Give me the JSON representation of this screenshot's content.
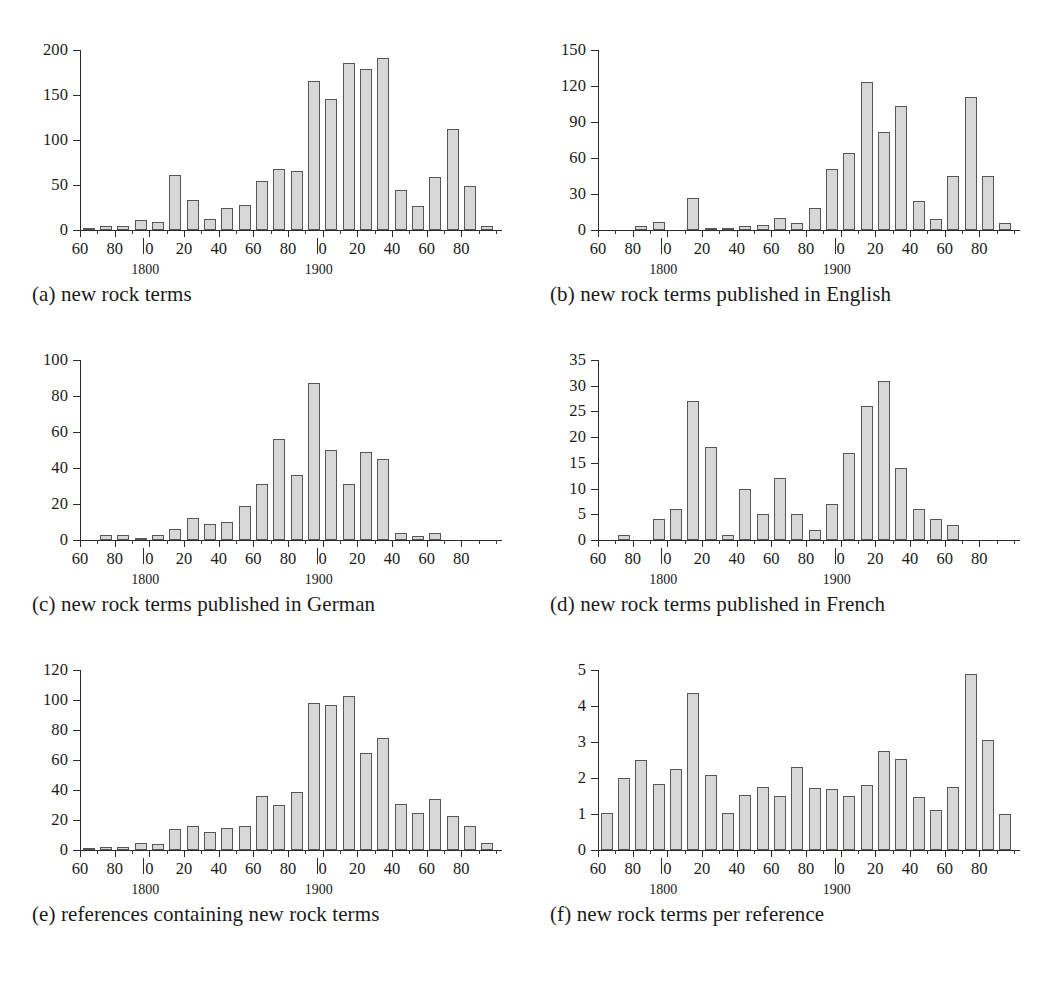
{
  "figure": {
    "panel_count": 6,
    "x_axis": {
      "decade_start": 1760,
      "decade_end": 1990,
      "bin_width_years": 10,
      "major_tick_labels": [
        "60",
        "80",
        "0",
        "20",
        "40",
        "60",
        "80",
        "0",
        "20",
        "40",
        "60",
        "80"
      ],
      "major_tick_years": [
        1760,
        1780,
        1800,
        1820,
        1840,
        1860,
        1880,
        1900,
        1920,
        1940,
        1960,
        1980
      ],
      "century_labels": [
        "1800",
        "1900"
      ],
      "century_years": [
        1800,
        1900
      ]
    },
    "bar_fill_color": "#d7d7d7",
    "bar_edge_color": "#565656",
    "axis_color": "#2b2b2b"
  },
  "chart_data": [
    {
      "id": "a",
      "type": "bar",
      "title": "",
      "caption": "(a) new rock terms",
      "xlabel": "",
      "ylabel": "",
      "ylim": [
        0,
        200
      ],
      "yticks": [
        0,
        50,
        100,
        150,
        200
      ],
      "grid": false,
      "legend": "none",
      "categories": [
        1760,
        1770,
        1780,
        1790,
        1800,
        1810,
        1820,
        1830,
        1840,
        1850,
        1860,
        1870,
        1880,
        1890,
        1900,
        1910,
        1920,
        1930,
        1940,
        1950,
        1960,
        1970,
        1980,
        1990
      ],
      "values": [
        1,
        4,
        5,
        11,
        9,
        61,
        33,
        12,
        24,
        28,
        54,
        68,
        66,
        166,
        146,
        186,
        179,
        191,
        45,
        27,
        59,
        112,
        49,
        5
      ]
    },
    {
      "id": "b",
      "type": "bar",
      "title": "",
      "caption": "(b) new rock terms published in English",
      "xlabel": "",
      "ylabel": "",
      "ylim": [
        0,
        150
      ],
      "yticks": [
        0,
        30,
        60,
        90,
        120,
        150
      ],
      "grid": false,
      "legend": "none",
      "categories": [
        1760,
        1770,
        1780,
        1790,
        1800,
        1810,
        1820,
        1830,
        1840,
        1850,
        1860,
        1870,
        1880,
        1890,
        1900,
        1910,
        1920,
        1930,
        1940,
        1950,
        1960,
        1970,
        1980,
        1990
      ],
      "values": [
        0,
        0,
        3,
        7,
        0,
        27,
        2,
        2,
        3,
        4,
        10,
        6,
        18,
        51,
        64,
        123,
        82,
        103,
        24,
        9,
        45,
        111,
        45,
        6
      ]
    },
    {
      "id": "c",
      "type": "bar",
      "title": "",
      "caption": "(c) new rock terms published in German",
      "xlabel": "",
      "ylabel": "",
      "ylim": [
        0,
        100
      ],
      "yticks": [
        0,
        20,
        40,
        60,
        80,
        100
      ],
      "grid": false,
      "legend": "none",
      "categories": [
        1760,
        1770,
        1780,
        1790,
        1800,
        1810,
        1820,
        1830,
        1840,
        1850,
        1860,
        1870,
        1880,
        1890,
        1900,
        1910,
        1920,
        1930,
        1940,
        1950,
        1960,
        1970,
        1980,
        1990
      ],
      "values": [
        0,
        3,
        3,
        1,
        3,
        6,
        12,
        9,
        10,
        19,
        31,
        56,
        36,
        87,
        50,
        31,
        49,
        45,
        4,
        2,
        4,
        0,
        0,
        0
      ]
    },
    {
      "id": "d",
      "type": "bar",
      "title": "",
      "caption": "(d) new rock terms published in French",
      "xlabel": "",
      "ylabel": "",
      "ylim": [
        0,
        35
      ],
      "yticks": [
        0,
        5,
        10,
        15,
        20,
        25,
        30,
        35
      ],
      "grid": false,
      "legend": "none",
      "categories": [
        1760,
        1770,
        1780,
        1790,
        1800,
        1810,
        1820,
        1830,
        1840,
        1850,
        1860,
        1870,
        1880,
        1890,
        1900,
        1910,
        1920,
        1930,
        1940,
        1950,
        1960,
        1970,
        1980,
        1990
      ],
      "values": [
        0,
        1,
        0,
        4,
        6,
        27,
        18,
        1,
        10,
        5,
        12,
        5,
        2,
        7,
        17,
        26,
        31,
        14,
        6,
        4,
        3,
        0,
        0,
        0
      ]
    },
    {
      "id": "e",
      "type": "bar",
      "title": "",
      "caption": "(e) references containing new rock terms",
      "xlabel": "",
      "ylabel": "",
      "ylim": [
        0,
        120
      ],
      "yticks": [
        0,
        20,
        40,
        60,
        80,
        100,
        120
      ],
      "grid": false,
      "legend": "none",
      "categories": [
        1760,
        1770,
        1780,
        1790,
        1800,
        1810,
        1820,
        1830,
        1840,
        1850,
        1860,
        1870,
        1880,
        1890,
        1900,
        1910,
        1920,
        1930,
        1940,
        1950,
        1960,
        1970,
        1980,
        1990
      ],
      "values": [
        1,
        2,
        2,
        5,
        4,
        14,
        16,
        12,
        15,
        16,
        36,
        30,
        39,
        98,
        97,
        103,
        65,
        75,
        31,
        25,
        34,
        23,
        16,
        5
      ]
    },
    {
      "id": "f",
      "type": "bar",
      "title": "",
      "caption": "(f) new rock terms per reference",
      "xlabel": "",
      "ylabel": "",
      "ylim": [
        0,
        5
      ],
      "yticks": [
        0,
        1,
        2,
        3,
        4,
        5
      ],
      "grid": false,
      "legend": "none",
      "categories": [
        1760,
        1770,
        1780,
        1790,
        1800,
        1810,
        1820,
        1830,
        1840,
        1850,
        1860,
        1870,
        1880,
        1890,
        1900,
        1910,
        1920,
        1930,
        1940,
        1950,
        1960,
        1970,
        1980,
        1990
      ],
      "values": [
        1.03,
        2.0,
        2.5,
        1.83,
        2.25,
        4.36,
        2.07,
        1.03,
        1.54,
        1.75,
        1.51,
        2.3,
        1.72,
        1.69,
        1.5,
        1.8,
        2.75,
        2.53,
        1.48,
        1.1,
        1.75,
        4.9,
        3.05,
        1.0
      ]
    }
  ]
}
